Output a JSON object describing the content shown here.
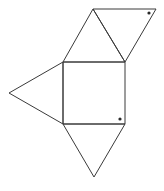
{
  "diagram": {
    "stroke_color": "#3a3a3a",
    "dot_color": "#2a2a2a",
    "shapes": {
      "square": [
        [
          63,
          62
        ],
        [
          125,
          62
        ],
        [
          125,
          124
        ],
        [
          63,
          124
        ]
      ],
      "top_triangle": [
        [
          63,
          62
        ],
        [
          93,
          9
        ],
        [
          125,
          62
        ]
      ],
      "top_right_triangle": [
        [
          93,
          9
        ],
        [
          156,
          9
        ],
        [
          125,
          62
        ]
      ],
      "left_triangle": [
        [
          63,
          62
        ],
        [
          9,
          93
        ],
        [
          63,
          124
        ]
      ],
      "bottom_triangle": [
        [
          63,
          124
        ],
        [
          94,
          177
        ],
        [
          125,
          124
        ]
      ]
    },
    "dots": [
      {
        "name": "dot-top-right-triangle",
        "x": 149,
        "y": 13,
        "r": 1.6
      },
      {
        "name": "dot-square",
        "x": 120,
        "y": 119,
        "r": 1.6
      }
    ]
  }
}
